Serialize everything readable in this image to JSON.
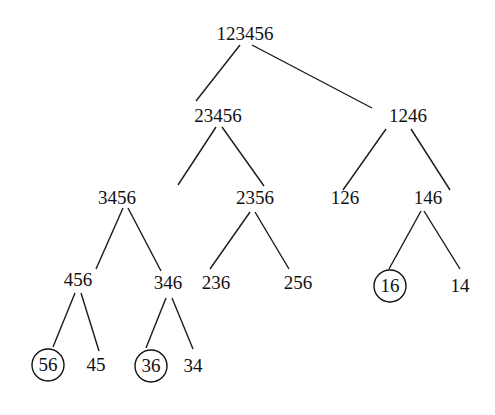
{
  "diagram": {
    "type": "tree",
    "nodes": [
      {
        "id": "n0",
        "label": "123456",
        "x": 245,
        "y": 40,
        "circled": false
      },
      {
        "id": "n1",
        "label": "23456",
        "x": 218,
        "y": 122,
        "circled": false
      },
      {
        "id": "n2",
        "label": "1246",
        "x": 408,
        "y": 122,
        "circled": false
      },
      {
        "id": "n3",
        "label": "3456",
        "x": 117,
        "y": 204,
        "circled": false
      },
      {
        "id": "n4",
        "label": "2356",
        "x": 255,
        "y": 204,
        "circled": false
      },
      {
        "id": "n5",
        "label": "126",
        "x": 345,
        "y": 204,
        "circled": false
      },
      {
        "id": "n6",
        "label": "146",
        "x": 428,
        "y": 204,
        "circled": false
      },
      {
        "id": "n7",
        "label": "456",
        "x": 78,
        "y": 286,
        "circled": false
      },
      {
        "id": "n8",
        "label": "346",
        "x": 168,
        "y": 289,
        "circled": false
      },
      {
        "id": "n9",
        "label": "236",
        "x": 216,
        "y": 289,
        "circled": false
      },
      {
        "id": "n10",
        "label": "256",
        "x": 298,
        "y": 289,
        "circled": false
      },
      {
        "id": "n11",
        "label": "16",
        "x": 390,
        "y": 292,
        "circled": true
      },
      {
        "id": "n12",
        "label": "14",
        "x": 460,
        "y": 292,
        "circled": false
      },
      {
        "id": "n13",
        "label": "56",
        "x": 48,
        "y": 371,
        "circled": true
      },
      {
        "id": "n14",
        "label": "45",
        "x": 96,
        "y": 371,
        "circled": false
      },
      {
        "id": "n15",
        "label": "36",
        "x": 151,
        "y": 372,
        "circled": true
      },
      {
        "id": "n16",
        "label": "34",
        "x": 193,
        "y": 372,
        "circled": false
      }
    ],
    "edges": [
      {
        "x1": 240,
        "y1": 45,
        "x2": 196,
        "y2": 101
      },
      {
        "x1": 252,
        "y1": 45,
        "x2": 372,
        "y2": 108
      },
      {
        "x1": 216,
        "y1": 127,
        "x2": 178,
        "y2": 185
      },
      {
        "x1": 222,
        "y1": 127,
        "x2": 264,
        "y2": 186
      },
      {
        "x1": 386,
        "y1": 129,
        "x2": 343,
        "y2": 190
      },
      {
        "x1": 411,
        "y1": 129,
        "x2": 450,
        "y2": 190
      },
      {
        "x1": 123,
        "y1": 208,
        "x2": 96,
        "y2": 269
      },
      {
        "x1": 128,
        "y1": 208,
        "x2": 161,
        "y2": 271
      },
      {
        "x1": 250,
        "y1": 212,
        "x2": 210,
        "y2": 269
      },
      {
        "x1": 255,
        "y1": 212,
        "x2": 289,
        "y2": 269
      },
      {
        "x1": 421,
        "y1": 211,
        "x2": 389,
        "y2": 269
      },
      {
        "x1": 424,
        "y1": 211,
        "x2": 460,
        "y2": 269
      },
      {
        "x1": 75,
        "y1": 293,
        "x2": 53,
        "y2": 347
      },
      {
        "x1": 81,
        "y1": 293,
        "x2": 99,
        "y2": 351
      },
      {
        "x1": 166,
        "y1": 298,
        "x2": 146,
        "y2": 348
      },
      {
        "x1": 172,
        "y1": 298,
        "x2": 193,
        "y2": 349
      }
    ]
  }
}
